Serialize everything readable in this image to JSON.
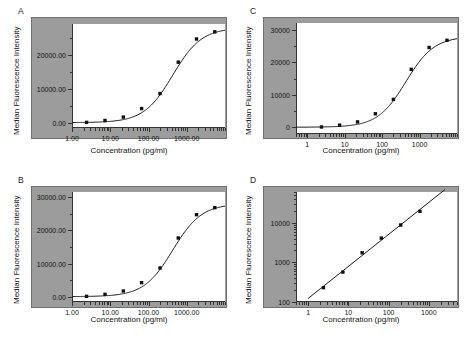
{
  "figure": {
    "axis_title_x": "Concentration (pg/ml)",
    "axis_title_y": "Median Fluorescence Intensity",
    "panel_background_color": "#9c9c9c",
    "plot_background_color": "#ffffff",
    "marker_color": "#111111",
    "curve_color": "#1a1a1a"
  },
  "panels": [
    {
      "letter": "A"
    },
    {
      "letter": "B"
    },
    {
      "letter": "C"
    },
    {
      "letter": "D"
    }
  ],
  "chart_data": [
    {
      "type": "scatter",
      "panel": "A",
      "title": "A",
      "xlabel": "Concentration (pg/ml)",
      "ylabel": "Median Fluorescence Intensity",
      "xscale": "log",
      "yscale": "linear",
      "xlim": [
        1,
        10000
      ],
      "ylim": [
        -1500,
        29000
      ],
      "xticks": [
        1,
        10,
        100,
        1000
      ],
      "xticklabels": [
        "1.00",
        "10.00",
        "100.00",
        "1000.00"
      ],
      "yticks": [
        0,
        10000,
        20000
      ],
      "yticklabels": [
        "0.00",
        "10000.00",
        "20000.00"
      ],
      "grid": false,
      "legend": "none",
      "x": [
        2.4,
        7.3,
        22,
        66,
        200,
        600,
        1800,
        5400
      ],
      "y": [
        150,
        700,
        1700,
        4200,
        8600,
        17800,
        24600,
        26700
      ],
      "fit": "four-parameter logistic (sigmoidal)"
    },
    {
      "type": "scatter",
      "panel": "B",
      "title": "B",
      "xlabel": "Concentration (pg/ml)",
      "ylabel": "Median Fluorescence Intensity",
      "xscale": "log",
      "yscale": "linear",
      "xlim": [
        1,
        10000
      ],
      "ylim": [
        -1500,
        31500
      ],
      "xticks": [
        1,
        10,
        100,
        1000
      ],
      "xticklabels": [
        "1.00",
        "10.00",
        "100.00",
        "1000.00"
      ],
      "yticks": [
        0,
        10000,
        20000,
        30000
      ],
      "yticklabels": [
        "0.00",
        "10000.00",
        "20000.00",
        "30000.00"
      ],
      "grid": false,
      "legend": "none",
      "x": [
        2.4,
        7.3,
        22,
        66,
        200,
        600,
        1800,
        5400
      ],
      "y": [
        200,
        800,
        1800,
        4300,
        8700,
        17700,
        24700,
        26800
      ],
      "fit": "four-parameter logistic (sigmoidal)"
    },
    {
      "type": "scatter",
      "panel": "C",
      "title": "C",
      "xlabel": "Concentration (pg/ml)",
      "ylabel": "Median Fluorescence Intensity",
      "xscale": "log",
      "yscale": "linear",
      "xlim": [
        0.5,
        10000
      ],
      "ylim": [
        -2000,
        32000
      ],
      "xticks": [
        1,
        10,
        100,
        1000
      ],
      "xticklabels": [
        "1",
        "10",
        "100",
        "1000"
      ],
      "yticks": [
        0,
        10000,
        20000,
        30000
      ],
      "yticklabels": [
        "0",
        "10000",
        "20000",
        "30000"
      ],
      "grid": false,
      "legend": "none",
      "x": [
        2.4,
        7.3,
        22,
        66,
        200,
        600,
        1800,
        5400
      ],
      "y": [
        150,
        700,
        1700,
        4200,
        8600,
        17800,
        24500,
        26700
      ],
      "fit": "four-parameter logistic (sigmoidal)"
    },
    {
      "type": "scatter",
      "panel": "D",
      "title": "D",
      "xlabel": "Concentration (pg/ml)",
      "ylabel": "Median Fluorescence Intensity",
      "xscale": "log",
      "yscale": "log",
      "xlim": [
        0.5,
        5000
      ],
      "ylim": [
        100,
        60000
      ],
      "xticks": [
        1,
        10,
        100,
        1000
      ],
      "xticklabels": [
        "1",
        "10",
        "100",
        "1000"
      ],
      "yticks": [
        100,
        1000,
        10000
      ],
      "yticklabels": [
        "100",
        "1000",
        "10000"
      ],
      "grid": false,
      "legend": "none",
      "x": [
        2.4,
        7.3,
        22,
        66,
        200,
        600
      ],
      "y": [
        230,
        570,
        1750,
        4100,
        8800,
        19500
      ],
      "fit": "log-log linear regression"
    }
  ]
}
